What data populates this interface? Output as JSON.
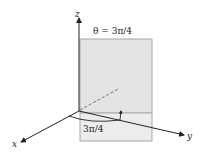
{
  "diagram": {
    "title_label": "θ = 3π/4",
    "angle_label": "3π/4",
    "axes": {
      "x": "x",
      "y": "y",
      "z": "z"
    },
    "colors": {
      "plane_fill": "#e3e3e3",
      "plane_edge": "#a8a8a8",
      "axis": "#222222",
      "dashed": "#555555"
    }
  }
}
